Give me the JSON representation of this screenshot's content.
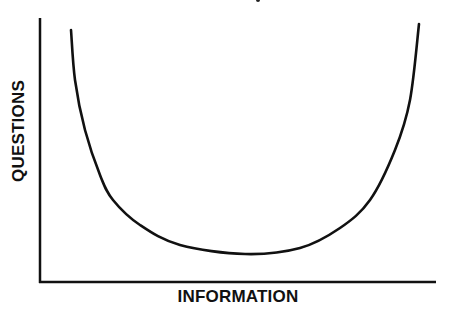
{
  "chart_data": {
    "type": "line",
    "title": "",
    "xlabel": "INFORMATION",
    "ylabel": "QUESTIONS",
    "grid": false,
    "legend": null,
    "ticks": {
      "x": [],
      "y": []
    },
    "series": [
      {
        "name": "questions-vs-information",
        "color": "#111111",
        "points_px": [
          [
            71,
            30
          ],
          [
            75,
            80
          ],
          [
            85,
            130
          ],
          [
            100,
            175
          ],
          [
            113,
            200
          ],
          [
            140,
            225
          ],
          [
            180,
            245
          ],
          [
            245,
            254
          ],
          [
            300,
            248
          ],
          [
            340,
            228
          ],
          [
            370,
            200
          ],
          [
            395,
            150
          ],
          [
            410,
            100
          ],
          [
            419,
            24
          ]
        ],
        "x": [
          0.08,
          0.09,
          0.11,
          0.15,
          0.19,
          0.25,
          0.36,
          0.52,
          0.66,
          0.76,
          0.83,
          0.9,
          0.93,
          0.96
        ],
        "y": [
          0.95,
          0.77,
          0.58,
          0.4,
          0.31,
          0.22,
          0.14,
          0.11,
          0.13,
          0.2,
          0.31,
          0.5,
          0.69,
          0.98
        ]
      }
    ],
    "xlim": [
      0,
      1
    ],
    "ylim": [
      0,
      1
    ]
  },
  "axes": {
    "x_label": "INFORMATION",
    "y_label": "QUESTIONS"
  }
}
